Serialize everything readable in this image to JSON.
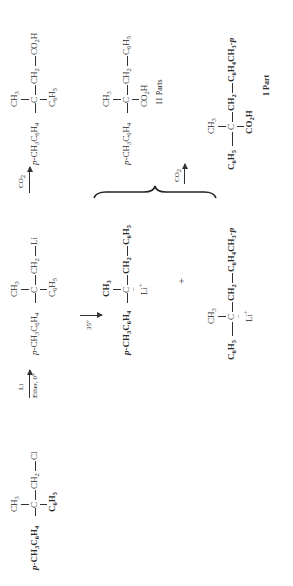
{
  "reaction_scheme": {
    "reactant": {
      "top": "CH3",
      "left": "p-CH3C6H4",
      "center": "C",
      "right1": "CH2",
      "right2": "Cl",
      "bottom": "C6H5"
    },
    "step1": {
      "reagent": "Li",
      "conditions": "Ether, 0°"
    },
    "intermediate": {
      "top": "CH3",
      "left": "p-CH3C6H4",
      "center": "C",
      "right1": "CH2",
      "right2": "Li",
      "bottom": "C6H5"
    },
    "step2_direct": {
      "reagent": "CO2"
    },
    "product_direct": {
      "top": "CH3",
      "left": "p-CH3C6H4",
      "center": "C",
      "right1": "CH2",
      "right2": "CO2H",
      "bottom": "C6H5"
    },
    "step_rearrangement": {
      "conditions": "35°"
    },
    "salt_1": {
      "top": "CH3",
      "left": "p-CH3C6H4",
      "center": "C",
      "right1": "CH2",
      "right2": "C6H5",
      "bottom": "Li+"
    },
    "plus": "+",
    "salt_2": {
      "top": "CH3",
      "left": "C6H5",
      "center": "C",
      "right1": "CH2",
      "right2": "C6H4CH3-p",
      "bottom": "Li+"
    },
    "step3": {
      "reagent": "CO2"
    },
    "product_1": {
      "top": "CH3",
      "left": "p-CH3C6H4",
      "center": "C",
      "right1": "CH2",
      "right2": "C6H5",
      "bottom": "CO2H",
      "ratio": "11 Parts"
    },
    "product_2": {
      "top": "CH3",
      "left": "C6H5",
      "center": "C",
      "right1": "CH2",
      "right2": "C6H4CH3-p",
      "bottom": "CO2H",
      "ratio": "1 Part"
    }
  }
}
